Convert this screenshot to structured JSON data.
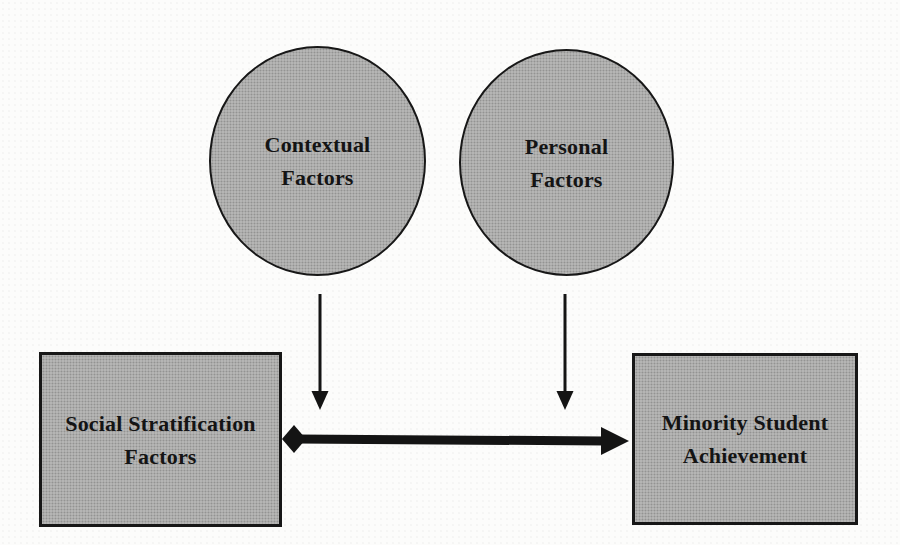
{
  "figure": {
    "kind": "conceptual-model-diagram",
    "colors": {
      "background": "#fcfcfb",
      "node_fill": "#afafae",
      "node_border": "#171717",
      "arrow": "#141414",
      "text": "#141414"
    },
    "nodes": {
      "contextual": {
        "shape": "circle",
        "lines": [
          "Contextual",
          "Factors"
        ]
      },
      "personal": {
        "shape": "circle",
        "lines": [
          "Personal",
          "Factors"
        ]
      },
      "social": {
        "shape": "rectangle",
        "lines": [
          "Social Stratification",
          "Factors"
        ]
      },
      "achievement": {
        "shape": "rectangle",
        "lines": [
          "Minority Student",
          "Achievement"
        ]
      }
    },
    "connectors": [
      {
        "id": "contextual-down-arrow",
        "from": "Contextual Factors",
        "to": "social-achievement link",
        "style": "thin",
        "end_cap": "arrowhead-down"
      },
      {
        "id": "personal-down-arrow",
        "from": "Personal Factors",
        "to": "social-achievement link",
        "style": "thin",
        "end_cap": "arrowhead-down"
      },
      {
        "id": "social-achievement-link",
        "from": "Social Stratification Factors",
        "to": "Minority Student Achievement",
        "style": "thick",
        "start_cap": "diamond",
        "end_cap": "arrowhead-right"
      }
    ]
  }
}
